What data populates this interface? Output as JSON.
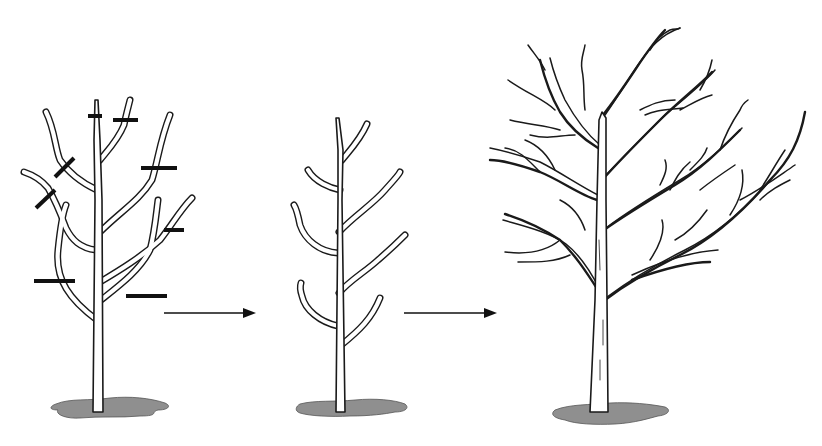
{
  "figure": {
    "background": "#ffffff",
    "line_color": "#1a1a1a",
    "ground_color": "#8f8f8f",
    "stages": [
      {
        "id": "stage-1",
        "label": "Young tree with pruning cuts marked",
        "cut_marks": 8
      },
      {
        "id": "stage-2",
        "label": "Pruned young tree (scaffold branches)",
        "cut_marks": 0
      },
      {
        "id": "stage-3",
        "label": "Mature tree with developed canopy",
        "cut_marks": 0
      }
    ],
    "arrows": [
      {
        "id": "arrow-1",
        "label": "to stage 2"
      },
      {
        "id": "arrow-2",
        "label": "to stage 3"
      }
    ]
  }
}
